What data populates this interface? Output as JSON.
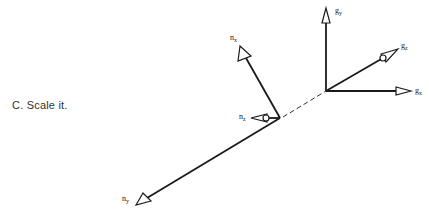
{
  "caption": "C. Scale it.",
  "diagram": {
    "n_frame": {
      "labels": {
        "x": "n",
        "x_sub": "x",
        "y": "n",
        "y_sub": "y",
        "z": "n",
        "z_sub": "z"
      }
    },
    "g_frame": {
      "labels": {
        "x": "g",
        "x_sub": "x",
        "y": "g",
        "y_sub": "y",
        "z": "g",
        "z_sub": "z"
      }
    },
    "colors": {
      "stroke": "#1a1a1a",
      "background": "#ffffff",
      "text": "#333333"
    }
  }
}
